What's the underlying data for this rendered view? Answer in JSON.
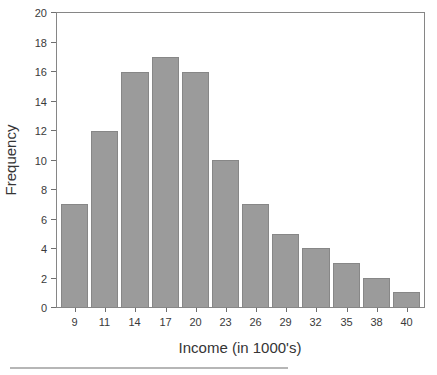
{
  "chart_data": {
    "type": "bar",
    "variant": "histogram",
    "title": "",
    "categories": [
      "9",
      "11",
      "14",
      "17",
      "20",
      "23",
      "26",
      "29",
      "32",
      "35",
      "38",
      "40"
    ],
    "values": [
      7,
      12,
      16,
      17,
      16,
      10,
      7,
      5,
      4,
      3,
      2,
      1
    ],
    "xlabel": "Income (in 1000's)",
    "ylabel": "Frequency",
    "ylim": [
      0,
      20
    ],
    "yticks": [
      0,
      2,
      4,
      6,
      8,
      10,
      12,
      14,
      16,
      18,
      20
    ],
    "grid": false,
    "legend": "none",
    "bar_color": "#9b9b9b",
    "bar_border_color": "#878787",
    "axis_box_color": "#868686",
    "tick_color": "#6f6f6f",
    "text_color": "#3a3a3a",
    "background_color": "#ffffff"
  },
  "decor": {
    "bottom_rule_color": "#b6b6b6"
  }
}
